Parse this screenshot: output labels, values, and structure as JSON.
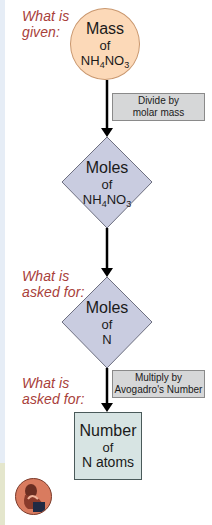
{
  "labels": {
    "given": {
      "line1": "What is",
      "line2": "given:"
    },
    "asked1": {
      "line1": "What is",
      "line2": "asked for:"
    },
    "asked2": {
      "line1": "What is",
      "line2": "asked for:"
    }
  },
  "nodes": {
    "start": {
      "shape": "circle",
      "title": "Mass",
      "of": "of",
      "formula_parts": [
        "NH",
        "4",
        "NO",
        "3"
      ]
    },
    "step1": {
      "shape": "diamond",
      "title": "Moles",
      "of": "of",
      "formula_parts": [
        "NH",
        "4",
        "NO",
        "3"
      ]
    },
    "step2": {
      "shape": "diamond",
      "title": "Moles",
      "of": "of",
      "subject": "N"
    },
    "end": {
      "shape": "square",
      "title": "Number",
      "of": "of",
      "subject": "N atoms"
    }
  },
  "operations": {
    "op1": {
      "line1": "Divide by",
      "line2": "molar mass"
    },
    "op2": {
      "line1": "Multiply by",
      "line2": "Avogadro's Number"
    }
  },
  "colors": {
    "label_text": "#a8403a",
    "circle_fill": "#fcd9b8",
    "diamond_fill": "#c9cce0",
    "operation_fill": "#d6d7d8",
    "final_fill": "#d7e4e3",
    "arrow": "#000000"
  },
  "icons": {
    "avatar": "thinker-avatar-icon"
  }
}
